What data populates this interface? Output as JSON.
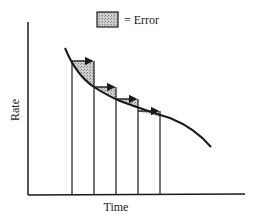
{
  "legend": {
    "label": "= Error",
    "swatch_fill": "#bdbdbd"
  },
  "axes": {
    "xlabel": "Time",
    "ylabel": "Rate"
  },
  "colors": {
    "ink": "#1a1a1a",
    "error_fill": "#bdbdbd",
    "background": "#ffffff"
  },
  "diagram": {
    "num_intervals": 4,
    "intervals": [
      {
        "x_start": 72,
        "x_end": 94,
        "top_y": 61
      },
      {
        "x_start": 94,
        "x_end": 116,
        "top_y": 87
      },
      {
        "x_start": 116,
        "x_end": 138,
        "top_y": 99
      },
      {
        "x_start": 138,
        "x_end": 160,
        "top_y": 111
      }
    ]
  }
}
